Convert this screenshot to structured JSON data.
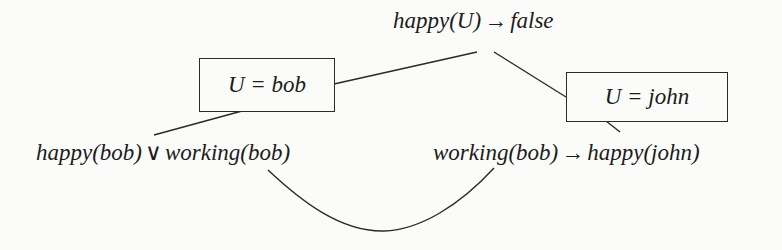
{
  "diagram": {
    "type": "resolution-tree",
    "root": {
      "pre": "happy(U)",
      "op": "→",
      "post": "false"
    },
    "substitutions": [
      {
        "label": "U = bob"
      },
      {
        "label": "U = john"
      }
    ],
    "leaves": [
      {
        "pre": "happy(bob)",
        "op": "∨",
        "post": "working(bob)"
      },
      {
        "pre": "working(bob)",
        "op": "→",
        "post": "happy(john)"
      }
    ],
    "edges": [
      {
        "from": "root",
        "to": "substitution-bob"
      },
      {
        "from": "substitution-bob",
        "to": "leaf-happy-or-working"
      },
      {
        "from": "root",
        "to": "substitution-john"
      },
      {
        "from": "substitution-john",
        "to": "leaf-working-implies-happy"
      },
      {
        "from": "leaf-happy-or-working",
        "to": "leaf-working-implies-happy",
        "style": "curve"
      }
    ],
    "colors": {
      "ink": "#1c1c1c",
      "paper": "#fbfbfa"
    }
  }
}
